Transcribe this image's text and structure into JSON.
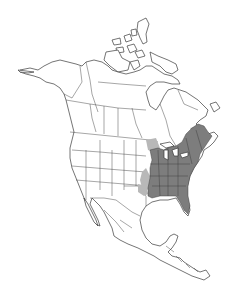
{
  "map": {
    "type": "species-range-map",
    "region": "North America",
    "colors": {
      "background": "#ffffff",
      "outline": "#3a3a3a",
      "range_primary": "#7d7d7d",
      "range_secondary": "#b8b8b8"
    },
    "layers": [
      {
        "name": "land-outline",
        "label": ""
      },
      {
        "name": "political-borders",
        "label": ""
      },
      {
        "name": "range-core",
        "label": ""
      },
      {
        "name": "range-periphery",
        "label": ""
      }
    ]
  }
}
